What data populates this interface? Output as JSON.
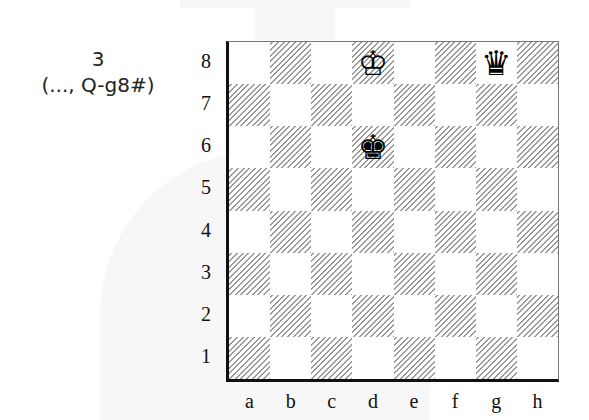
{
  "caption": {
    "move_number": "3",
    "move_text": "(..., Q-g8#)"
  },
  "board": {
    "files": [
      "a",
      "b",
      "c",
      "d",
      "e",
      "f",
      "g",
      "h"
    ],
    "ranks": [
      "8",
      "7",
      "6",
      "5",
      "4",
      "3",
      "2",
      "1"
    ],
    "orientation": "white-bottom",
    "pieces": [
      {
        "square": "d8",
        "piece": "white-king",
        "glyph": "♔"
      },
      {
        "square": "g8",
        "piece": "black-queen",
        "glyph": "♛"
      },
      {
        "square": "d6",
        "piece": "black-king",
        "glyph": "♚"
      }
    ]
  },
  "colors": {
    "dark_square_hatch": "#9a9a9a",
    "light_square": "#ffffff",
    "border": "#111111"
  }
}
